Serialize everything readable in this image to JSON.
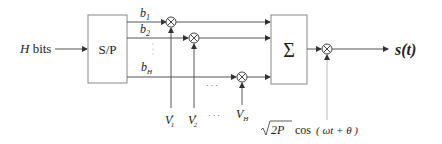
{
  "diagram": {
    "input_label": {
      "var": "H",
      "text": " bits"
    },
    "sp_block": {
      "label": "S/P"
    },
    "sum_block": {
      "label": "Σ"
    },
    "branches": [
      {
        "bit": "b",
        "sub": "1",
        "vol": "V",
        "vsub": "1",
        "vsup": "r"
      },
      {
        "bit": "b",
        "sub": "2",
        "vol": "V",
        "vsub": "2",
        "vsup": "r"
      },
      {
        "bit": "b",
        "sub": "H",
        "vol": "V",
        "vsub": "H",
        "vsup": ""
      }
    ],
    "ellipsis": "· · ·",
    "carrier": {
      "sqrt": "2P",
      "fn": "cos",
      "arg": "( ωt + θ )"
    },
    "output_label": "s(t)",
    "colors": {
      "line": "#555555",
      "text": "#222222",
      "box_stroke": "#888888",
      "carrier_line": "#bbbbbb"
    }
  }
}
